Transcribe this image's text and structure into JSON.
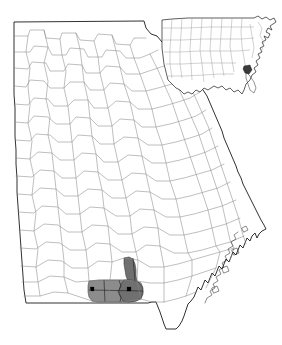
{
  "map": {
    "title": "Georgia County Map",
    "state_name": "Georgia",
    "background_color": "#ffffff",
    "state_outline_color": "#1a1a1a",
    "county_line_color": "#8a8a8a",
    "highlight_light_color": "#8c8c8c",
    "highlight_dark_color": "#707070",
    "city_marker_color": "#000000",
    "highlighted_region_label": "Highlighted county group",
    "city_markers": [
      {
        "name": "city-marker-west",
        "x": 92,
        "y": 289
      },
      {
        "name": "city-marker-east",
        "x": 129,
        "y": 289
      }
    ]
  },
  "inset": {
    "title": "United States Locator Inset",
    "outline_color": "#1a1a1a",
    "line_color": "#9a9a9a",
    "label": "United States"
  }
}
